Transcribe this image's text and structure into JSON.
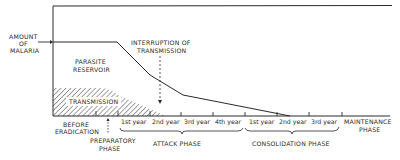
{
  "diagram": {
    "y_label": [
      "AMOUNT",
      "OF",
      "MALARIA"
    ],
    "regions": {
      "parasite_reservoir": [
        "PARASITE",
        "RESERVOIR"
      ],
      "transmission": "TRANSMISSION"
    },
    "annotation": [
      "INTERRUPTION OF",
      "TRANSMISSION"
    ],
    "phases": {
      "before": [
        "BEFORE",
        "ERADICATION"
      ],
      "preparatory": [
        "PREPARATORY",
        "PHASE"
      ],
      "attack": "ATTACK  PHASE",
      "consolidation": "CONSOLIDATION PHASE",
      "maintenance": [
        "MAINTENANCE",
        "PHASE"
      ]
    },
    "years": {
      "attack": [
        "1st year",
        "2nd year",
        "3rd year",
        "4th year"
      ],
      "consolidation": [
        "1st year",
        "2nd year",
        "3rd year"
      ]
    },
    "colors": {
      "ink": "#2a2a2a",
      "background": "#ffffff"
    }
  }
}
